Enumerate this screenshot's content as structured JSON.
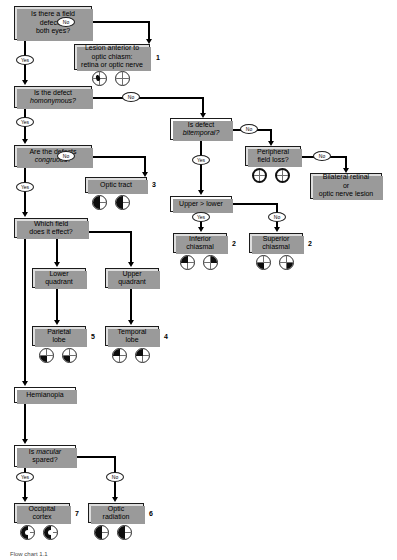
{
  "figure": {
    "caption": "Flow chart 1.1"
  },
  "nodes": {
    "q_both_eyes": {
      "label": "Is there a field\ndefect in\nboth eyes?"
    },
    "r_anterior": {
      "label": "Lesion anterior to\noptic chiasm:\nretina or optic nerve",
      "index": "1"
    },
    "q_homonymous": {
      "label_pre": "Is the defect\n",
      "label_em": "homonymous?"
    },
    "q_congruous": {
      "label_pre": "Are the defects\n",
      "label_em": "congruous?"
    },
    "r_optic_tract": {
      "label": "Optic tract",
      "index": "3"
    },
    "q_which_field": {
      "label": "Which field\ndoes it effect?"
    },
    "n_lower_quadrant": {
      "label": "Lower\nquadrant"
    },
    "n_upper_quadrant": {
      "label": "Upper\nquadrant"
    },
    "r_parietal": {
      "label": "Parietal\nlobe",
      "index": "5"
    },
    "r_temporal": {
      "label": "Temporal\nlobe",
      "index": "4"
    },
    "n_hemianopia": {
      "label": "Hemianopia"
    },
    "q_macular": {
      "label_pre": "Is ",
      "label_em": "macular",
      "label_post": "\nspared?"
    },
    "r_occipital": {
      "label": "Occipital\ncortex",
      "index": "7"
    },
    "r_optic_radiation": {
      "label": "Optic\nradiation",
      "index": "6"
    },
    "q_bitemporal": {
      "label_pre": "Is defect\n",
      "label_em": "bitemporal?"
    },
    "q_peripheral": {
      "label": "Peripheral\nfield loss?"
    },
    "r_bilateral": {
      "label": "Bilateral retinal\nor\noptic nerve lesion"
    },
    "q_upper_lower": {
      "label": "Upper > lower"
    },
    "r_inferior_chiasmal": {
      "label": "Inferior\nchiasmal",
      "index": "2"
    },
    "r_superior_chiasmal": {
      "label": "Superior\nchiasmal",
      "index": "2"
    }
  },
  "edges": {
    "yes_label": "Yes",
    "no_label": "No",
    "branches": [
      {
        "from": "q_both_eyes",
        "answer": "No",
        "to": "r_anterior"
      },
      {
        "from": "q_both_eyes",
        "answer": "Yes",
        "to": "q_homonymous"
      },
      {
        "from": "q_homonymous",
        "answer": "No",
        "to": "q_bitemporal"
      },
      {
        "from": "q_homonymous",
        "answer": "Yes",
        "to": "q_congruous"
      },
      {
        "from": "q_congruous",
        "answer": "No",
        "to": "r_optic_tract"
      },
      {
        "from": "q_congruous",
        "answer": "Yes",
        "to": "q_which_field"
      },
      {
        "from": "q_which_field",
        "answer": "",
        "to": "n_lower_quadrant"
      },
      {
        "from": "q_which_field",
        "answer": "",
        "to": "n_upper_quadrant"
      },
      {
        "from": "q_which_field",
        "answer": "",
        "to": "n_hemianopia"
      },
      {
        "from": "n_lower_quadrant",
        "answer": "",
        "to": "r_parietal"
      },
      {
        "from": "n_upper_quadrant",
        "answer": "",
        "to": "r_temporal"
      },
      {
        "from": "n_hemianopia",
        "answer": "",
        "to": "q_macular"
      },
      {
        "from": "q_macular",
        "answer": "Yes",
        "to": "r_occipital"
      },
      {
        "from": "q_macular",
        "answer": "No",
        "to": "r_optic_radiation"
      },
      {
        "from": "q_bitemporal",
        "answer": "No",
        "to": "q_peripheral"
      },
      {
        "from": "q_bitemporal",
        "answer": "Yes",
        "to": "q_upper_lower"
      },
      {
        "from": "q_peripheral",
        "answer": "No",
        "to": "r_bilateral"
      },
      {
        "from": "q_upper_lower",
        "answer": "Yes",
        "to": "r_inferior_chiasmal"
      },
      {
        "from": "q_upper_lower",
        "answer": "No",
        "to": "r_superior_chiasmal"
      }
    ]
  },
  "field_icons": {
    "anterior": {
      "left": "central-scotoma",
      "right": "normal"
    },
    "optic_tract": {
      "left": "left-hemianopia",
      "right": "left-hemianopia"
    },
    "parietal": {
      "left": "lower-left-quadrantanopia",
      "right": "lower-left-quadrantanopia"
    },
    "temporal": {
      "left": "upper-left-quadrantanopia",
      "right": "upper-left-quadrantanopia"
    },
    "occipital": {
      "left": "left-hemianopia-macular-sparing",
      "right": "left-hemianopia-macular-sparing"
    },
    "optic_radiation": {
      "left": "left-hemianopia",
      "right": "left-hemianopia"
    },
    "peripheral": {
      "left": "peripheral-constriction",
      "right": "peripheral-constriction"
    },
    "inferior_chiasmal": {
      "left": "upper-temporal-quadrant",
      "right": "upper-temporal-quadrant"
    },
    "superior_chiasmal": {
      "left": "lower-temporal-quadrant",
      "right": "lower-temporal-quadrant"
    }
  },
  "colors": {
    "box_border": "#1b1b1b",
    "box_shaded": "#dedede",
    "box_plain": "#ffffff",
    "line": "#000000",
    "defect_fill": "#0d0d0d"
  }
}
